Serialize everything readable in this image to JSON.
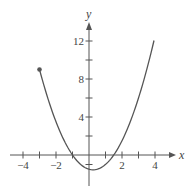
{
  "chart_data": {
    "type": "line",
    "title": "",
    "xlabel": "x",
    "ylabel": "y",
    "function": "y = x^2 - 0.5x - 1.5",
    "x_range": [
      -3,
      3.94
    ],
    "xlim": [
      -4.8,
      5
    ],
    "ylim": [
      -3,
      14
    ],
    "x_ticks": [
      -4,
      -3,
      -2,
      -1,
      1,
      2,
      3,
      4
    ],
    "x_tick_labels": [
      "-4",
      "-2",
      "2",
      "4"
    ],
    "x_tick_label_values": [
      -4,
      -2,
      2,
      4
    ],
    "y_ticks": [
      -1,
      2,
      4,
      6,
      8,
      10,
      12
    ],
    "y_tick_labels": [
      "4",
      "8",
      "12"
    ],
    "y_tick_label_values": [
      4,
      8,
      12
    ],
    "points": [
      {
        "x": -3,
        "y": 9
      },
      {
        "x": -2,
        "y": 3.5
      },
      {
        "x": -1,
        "y": 0
      },
      {
        "x": 0,
        "y": -1.5
      },
      {
        "x": 0.25,
        "y": -1.5625
      },
      {
        "x": 1,
        "y": -1
      },
      {
        "x": 1.5,
        "y": 0
      },
      {
        "x": 2,
        "y": 1.5
      },
      {
        "x": 3,
        "y": 6
      },
      {
        "x": 3.94,
        "y": 12
      }
    ],
    "closed_endpoint": {
      "x": -3,
      "y": 9
    },
    "grid": false,
    "legend": null,
    "colors": {
      "curve": "#555555",
      "axis": "#555555",
      "endpoint": "#555555"
    }
  }
}
